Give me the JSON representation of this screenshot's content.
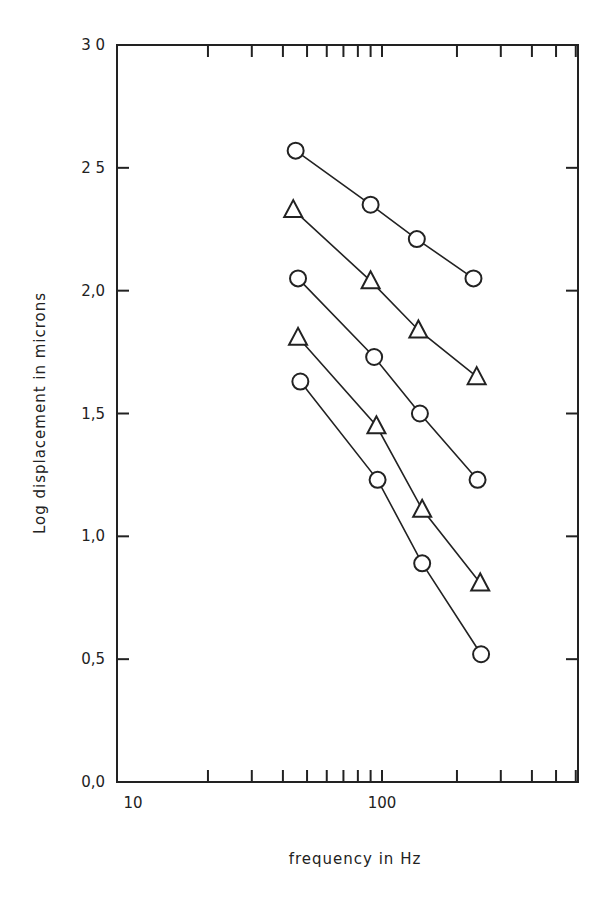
{
  "chart_data": {
    "type": "line",
    "title": "",
    "xlabel": "frequency in Hz",
    "ylabel": "Log displacement in microns",
    "xscale": "log",
    "xlim": [
      10,
      612
    ],
    "ylim": [
      0.0,
      3.0
    ],
    "x_tick_labels": [
      "10",
      "100"
    ],
    "y_tick_labels": [
      "0,0",
      "0,5",
      "1,0",
      "1,5",
      "2,0",
      "2 5",
      "3 0"
    ],
    "y_ticks": [
      0.0,
      0.5,
      1.0,
      1.5,
      2.0,
      2.5,
      3.0
    ],
    "grid": false,
    "legend": null,
    "series": [
      {
        "name": "series 1",
        "marker": "circle",
        "x": [
          45,
          90,
          138,
          233
        ],
        "y": [
          2.57,
          2.35,
          2.21,
          2.05
        ]
      },
      {
        "name": "series 2",
        "marker": "triangle",
        "x": [
          44,
          90,
          140,
          240
        ],
        "y": [
          2.33,
          2.04,
          1.84,
          1.65
        ]
      },
      {
        "name": "series 3",
        "marker": "circle",
        "x": [
          46,
          93,
          142,
          242
        ],
        "y": [
          2.05,
          1.73,
          1.5,
          1.23
        ]
      },
      {
        "name": "series 4",
        "marker": "triangle",
        "x": [
          46,
          95,
          145,
          248
        ],
        "y": [
          1.81,
          1.45,
          1.11,
          0.81
        ]
      },
      {
        "name": "series 5",
        "marker": "circle",
        "x": [
          47,
          96,
          145,
          250
        ],
        "y": [
          1.63,
          1.23,
          0.89,
          0.52
        ]
      }
    ]
  }
}
